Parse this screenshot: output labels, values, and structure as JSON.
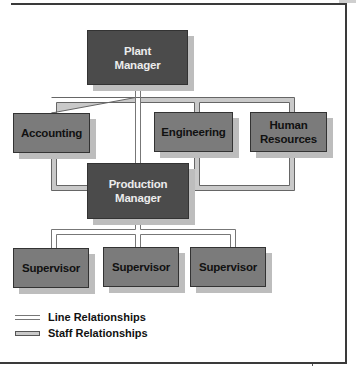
{
  "diagram": {
    "type": "org-chart",
    "nodes": [
      {
        "id": "plant-manager",
        "label": "Plant Manager",
        "lines": [
          "Plant",
          "Manager"
        ],
        "style": "dark",
        "level": 0
      },
      {
        "id": "accounting",
        "label": "Accounting",
        "lines": [
          "Accounting"
        ],
        "style": "mid",
        "level": 1,
        "relation": "staff"
      },
      {
        "id": "engineering",
        "label": "Engineering",
        "lines": [
          "Engineering"
        ],
        "style": "mid",
        "level": 1,
        "relation": "staff"
      },
      {
        "id": "human-resources",
        "label": "Human Resources",
        "lines": [
          "Human",
          "Resources"
        ],
        "style": "mid",
        "level": 1,
        "relation": "staff"
      },
      {
        "id": "production-manager",
        "label": "Production Manager",
        "lines": [
          "Production",
          "Manager"
        ],
        "style": "dark",
        "level": 2,
        "relation": "line"
      },
      {
        "id": "supervisor-1",
        "label": "Supervisor",
        "lines": [
          "Supervisor"
        ],
        "style": "mid",
        "level": 3,
        "relation": "line"
      },
      {
        "id": "supervisor-2",
        "label": "Supervisor",
        "lines": [
          "Supervisor"
        ],
        "style": "mid",
        "level": 3,
        "relation": "line"
      },
      {
        "id": "supervisor-3",
        "label": "Supervisor",
        "lines": [
          "Supervisor"
        ],
        "style": "mid",
        "level": 3,
        "relation": "line"
      }
    ],
    "edges": [
      {
        "from": "plant-manager",
        "to": "production-manager",
        "type": "line"
      },
      {
        "from": "plant-manager",
        "to": "accounting",
        "type": "staff"
      },
      {
        "from": "plant-manager",
        "to": "engineering",
        "type": "staff"
      },
      {
        "from": "plant-manager",
        "to": "human-resources",
        "type": "staff"
      },
      {
        "from": "accounting",
        "to": "production-manager",
        "type": "staff"
      },
      {
        "from": "engineering",
        "to": "production-manager",
        "type": "staff"
      },
      {
        "from": "human-resources",
        "to": "production-manager",
        "type": "staff"
      },
      {
        "from": "production-manager",
        "to": "supervisor-1",
        "type": "line"
      },
      {
        "from": "production-manager",
        "to": "supervisor-2",
        "type": "line"
      },
      {
        "from": "production-manager",
        "to": "supervisor-3",
        "type": "line"
      }
    ]
  },
  "legend": {
    "line": "Line Relationships",
    "staff": "Staff Relationships"
  },
  "colors": {
    "dark_box": "#4b4b4b",
    "mid_box": "#7b7b7b",
    "staff_fill": "#c9c9c9",
    "line_stroke": "#777777"
  }
}
